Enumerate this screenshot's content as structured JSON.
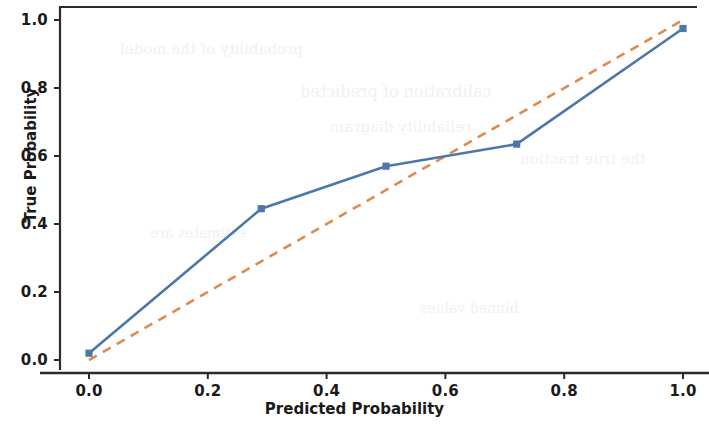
{
  "figure": {
    "background": "#ffffff",
    "line_color": "#4c78a8",
    "reference_color": "#e08a4e",
    "axis_color": "#2b2b2b"
  },
  "chart_data": {
    "type": "line",
    "title": "",
    "xlabel": "Predicted Probability",
    "ylabel": "True Probability",
    "xlim": [
      -0.05,
      1.05
    ],
    "ylim": [
      -0.05,
      1.06
    ],
    "grid": false,
    "legend": "none",
    "xticks": [
      "0.0",
      "0.2",
      "0.4",
      "0.6",
      "0.8",
      "1.0"
    ],
    "xtick_values": [
      0.0,
      0.2,
      0.4,
      0.6,
      0.8,
      1.0
    ],
    "yticks": [
      "0.0",
      "0.2",
      "0.4",
      "0.6",
      "0.8",
      "1.0"
    ],
    "ytick_values": [
      0.0,
      0.2,
      0.4,
      0.6,
      0.8,
      1.0
    ],
    "series": [
      {
        "name": "Calibration curve",
        "style": "solid",
        "marker": "square",
        "color": "#4c78a8",
        "x": [
          0.0,
          0.29,
          0.5,
          0.72,
          1.0
        ],
        "values": [
          0.02,
          0.445,
          0.57,
          0.635,
          0.975
        ]
      },
      {
        "name": "Perfectly calibrated",
        "style": "dashed",
        "marker": "none",
        "color": "#e08a4e",
        "x": [
          0.0,
          1.0
        ],
        "values": [
          0.0,
          1.0
        ]
      }
    ]
  },
  "bleed_text": {
    "a": "probability of the model",
    "b": "calibration of predicted",
    "c": "reliability diagram",
    "d": "the true fraction",
    "e": "estimates are",
    "f": "binned values"
  }
}
